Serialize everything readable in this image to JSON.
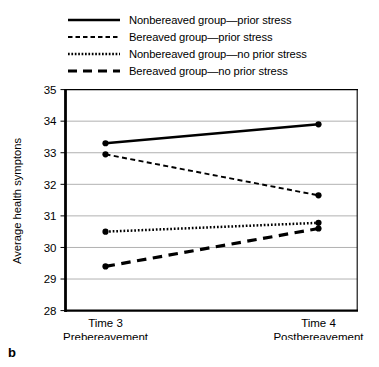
{
  "figure": {
    "panel_label": "b"
  },
  "legend": {
    "position": "top",
    "entries": [
      {
        "label": "Nonbereaved group—prior stress",
        "style": "solid",
        "icon": "solid-line-icon"
      },
      {
        "label": "Bereaved group—prior stress",
        "style": "dashed",
        "icon": "dashed-line-icon"
      },
      {
        "label": "Nonbereaved group—no prior stress",
        "style": "dotted",
        "icon": "dotted-line-icon"
      },
      {
        "label": "Bereaved group—no prior stress",
        "style": "longdash",
        "icon": "long-dashed-line-icon"
      }
    ]
  },
  "chart_data": {
    "type": "line",
    "title": "",
    "subtitle": "",
    "xlabel": "",
    "ylabel": "Average health symptons",
    "categories": [
      "Time 3",
      "Time 4"
    ],
    "xtick_labels": [
      {
        "line1": "Time 3",
        "line2": "Prebereavement"
      },
      {
        "line1": "Time 4",
        "line2": "Postbereavement"
      }
    ],
    "ylim": [
      28,
      35
    ],
    "yticks": [
      28,
      29,
      30,
      31,
      32,
      33,
      34,
      35
    ],
    "ytick_labels": [
      "28",
      "29",
      "30",
      "31",
      "32",
      "33",
      "34",
      "35"
    ],
    "grid": true,
    "grid_axis": "y",
    "series": [
      {
        "name": "Nonbereaved group—prior stress",
        "style": "solid",
        "values": [
          33.3,
          33.9
        ]
      },
      {
        "name": "Bereaved group—prior stress",
        "style": "dashed",
        "values": [
          32.95,
          31.65
        ]
      },
      {
        "name": "Nonbereaved group—no prior stress",
        "style": "dotted",
        "values": [
          30.5,
          30.78
        ]
      },
      {
        "name": "Bereaved group—no prior stress",
        "style": "longdash",
        "values": [
          29.4,
          30.6
        ]
      }
    ],
    "colors": {
      "line": "#000000",
      "grid": "#a8a8a8",
      "axis": "#000000",
      "background": "#ffffff"
    }
  }
}
